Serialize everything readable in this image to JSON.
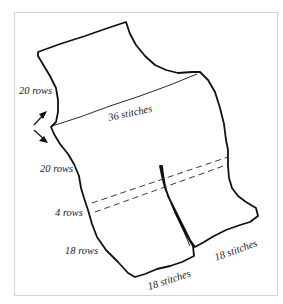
{
  "diagram": {
    "type": "knitting-schematic",
    "labels": {
      "rows_upper": "20 rows",
      "stitches_width": "36 stitches",
      "rows_middle": "20 rows",
      "rows_band": "4 rows",
      "rows_leg": "18 rows",
      "stitches_left_leg": "18 stitches",
      "stitches_right_leg": "18 stitches"
    },
    "colors": {
      "outline": "#111111",
      "frame": "#d4d4d4",
      "background": "#ffffff"
    }
  }
}
